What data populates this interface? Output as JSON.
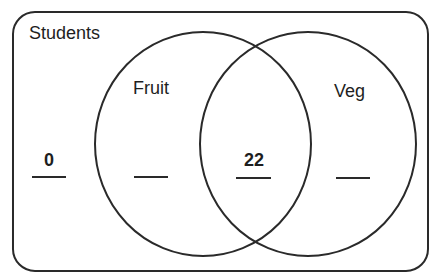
{
  "diagram": {
    "type": "venn",
    "universe_label": "Students",
    "sets": [
      {
        "name": "Fruit"
      },
      {
        "name": "Veg"
      }
    ],
    "regions": {
      "outside": {
        "value": "0"
      },
      "fruit_only": {
        "value": ""
      },
      "both": {
        "value": "22"
      },
      "veg_only": {
        "value": ""
      }
    }
  },
  "colors": {
    "stroke": "#2a2a2a",
    "text": "#1e1e1e",
    "background": "#ffffff"
  }
}
